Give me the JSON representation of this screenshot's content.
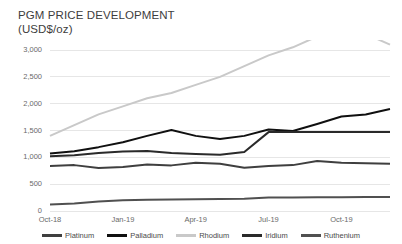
{
  "chart_data": {
    "type": "line",
    "title": "PGM PRICE DEVELOPMENT\n(USD$/oz)",
    "title_line1": "PGM PRICE DEVELOPMENT",
    "title_line2": "(USD$/oz)",
    "xlabel": "",
    "ylabel": "",
    "ylim": [
      0,
      3000
    ],
    "ytick_labels": [
      "0",
      "500",
      "1,000",
      "1,500",
      "2,000",
      "2,500",
      "3,000"
    ],
    "ytick_values": [
      0,
      500,
      1000,
      1500,
      2000,
      2500,
      3000
    ],
    "xtick_labels": [
      "Oct-18",
      "Jan-19",
      "Apr-19",
      "Jul-19",
      "Oct-19"
    ],
    "x": [
      "Oct-18",
      "Nov-18",
      "Dec-18",
      "Jan-19",
      "Feb-19",
      "Mar-19",
      "Apr-19",
      "May-19",
      "Jun-19",
      "Jul-19",
      "Aug-19",
      "Sep-19",
      "Oct-19",
      "Nov-19",
      "Dec-19"
    ],
    "grid": true,
    "legend_position": "bottom",
    "series": [
      {
        "name": "Platinum",
        "color": "#3f3f3f",
        "values": [
          840,
          855,
          800,
          820,
          865,
          850,
          900,
          880,
          805,
          840,
          855,
          930,
          900,
          890,
          880
        ]
      },
      {
        "name": "Palladium",
        "color": "#101010",
        "values": [
          1070,
          1115,
          1190,
          1280,
          1400,
          1510,
          1400,
          1340,
          1400,
          1520,
          1490,
          1620,
          1760,
          1800,
          1900
        ]
      },
      {
        "name": "Rhodium",
        "color": "#c9c9c9",
        "values": [
          1400,
          1600,
          1800,
          1950,
          2100,
          2200,
          2350,
          2500,
          2700,
          2900,
          3050,
          3250,
          3400,
          3300,
          3100
        ]
      },
      {
        "name": "Iridium",
        "color": "#2a2a2a",
        "values": [
          1020,
          1040,
          1080,
          1110,
          1120,
          1080,
          1060,
          1050,
          1100,
          1470,
          1470,
          1470,
          1470,
          1470,
          1470
        ]
      },
      {
        "name": "Ruthenium",
        "color": "#505050",
        "values": [
          120,
          140,
          175,
          200,
          210,
          215,
          220,
          225,
          230,
          250,
          252,
          255,
          258,
          260,
          262
        ]
      }
    ]
  },
  "legend": {
    "items": [
      {
        "label": "Platinum",
        "color": "#3f3f3f"
      },
      {
        "label": "Palladium",
        "color": "#101010"
      },
      {
        "label": "Rhodium",
        "color": "#c9c9c9"
      },
      {
        "label": "Iridium",
        "color": "#2a2a2a"
      },
      {
        "label": "Ruthenium",
        "color": "#505050"
      }
    ]
  },
  "axis": {
    "gridline_color": "#e6e6e6",
    "tick_text_color": "#6a6a6a"
  }
}
